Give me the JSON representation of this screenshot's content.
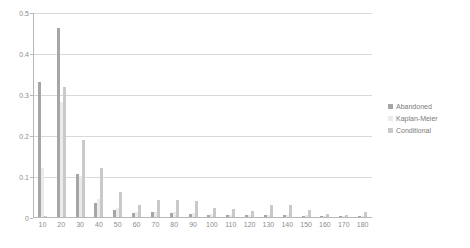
{
  "chart_data": {
    "type": "bar",
    "title": "",
    "subtitle": "",
    "xlabel": "",
    "ylabel": "",
    "ylim": [
      0,
      0.5
    ],
    "ytick_labels": [
      "0",
      "0.1",
      "0.2",
      "0.3",
      "0.4",
      "0.5"
    ],
    "ytick_values": [
      0,
      0.1,
      0.2,
      0.3,
      0.4,
      0.5
    ],
    "grid": true,
    "grid_axis": "y",
    "legend_position": "right",
    "categories": [
      "10",
      "20",
      "30",
      "40",
      "50",
      "60",
      "70",
      "80",
      "90",
      "100",
      "110",
      "120",
      "130",
      "140",
      "150",
      "160",
      "170",
      "180"
    ],
    "series": [
      {
        "name": "Abandoned",
        "color": "#a6a6a6",
        "values": [
          0.33,
          0.462,
          0.105,
          0.035,
          0.018,
          0.01,
          0.012,
          0.01,
          0.008,
          0.006,
          0.005,
          0.004,
          0.004,
          0.004,
          0.003,
          0.002,
          0.002,
          0.002
        ]
      },
      {
        "name": "Kaplan-Meier",
        "color": "#ebebeb",
        "values": [
          0.12,
          0.28,
          0.1,
          0.045,
          0.022,
          0.012,
          0.013,
          0.012,
          0.01,
          0.007,
          0.006,
          0.005,
          0.005,
          0.005,
          0.004,
          0.003,
          0.003,
          0.003
        ]
      },
      {
        "name": "Conditional",
        "color": "#c9c9c9",
        "values": [
          0.003,
          0.318,
          0.188,
          0.12,
          0.062,
          0.03,
          0.042,
          0.042,
          0.04,
          0.022,
          0.02,
          0.014,
          0.03,
          0.03,
          0.016,
          0.008,
          0.005,
          0.012
        ]
      }
    ]
  },
  "legend": {
    "items": [
      {
        "label": "Abandoned"
      },
      {
        "label": "Kaplan-Meier"
      },
      {
        "label": "Conditional"
      }
    ]
  }
}
